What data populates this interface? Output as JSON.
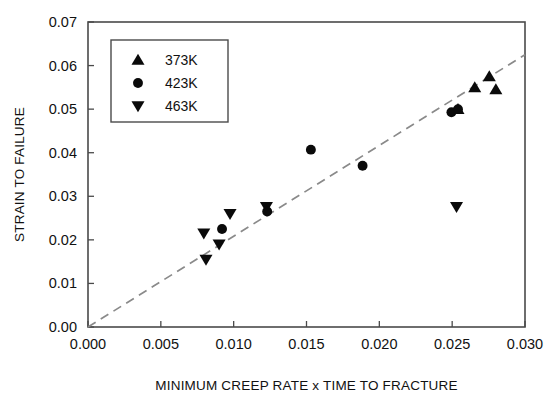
{
  "chart_data": {
    "type": "scatter",
    "title": "",
    "xlabel": "MINIMUM CREEP RATE x TIME TO FRACTURE",
    "ylabel": "STRAIN TO FAILURE",
    "xlim": [
      0.0,
      0.03
    ],
    "ylim": [
      0.0,
      0.07
    ],
    "xticks": [
      0.0,
      0.005,
      0.01,
      0.015,
      0.02,
      0.025,
      0.03
    ],
    "xticklabels": [
      "0.000",
      "0.005",
      "0.010",
      "0.015",
      "0.020",
      "0.025",
      "0.030"
    ],
    "yticks": [
      0.0,
      0.01,
      0.02,
      0.03,
      0.04,
      0.05,
      0.06,
      0.07
    ],
    "yticklabels": [
      "0.00",
      "0.01",
      "0.02",
      "0.03",
      "0.04",
      "0.05",
      "0.06",
      "0.07"
    ],
    "grid": false,
    "legend_position": "upper left",
    "series": [
      {
        "name": "373K",
        "marker": "triangle-up",
        "color": "#0a0a0a",
        "points": [
          {
            "x": 0.0254,
            "y": 0.05
          },
          {
            "x": 0.02655,
            "y": 0.055
          },
          {
            "x": 0.02755,
            "y": 0.0575
          },
          {
            "x": 0.028,
            "y": 0.0545
          }
        ]
      },
      {
        "name": "423K",
        "marker": "circle",
        "color": "#0a0a0a",
        "points": [
          {
            "x": 0.0092,
            "y": 0.0225
          },
          {
            "x": 0.0123,
            "y": 0.0265
          },
          {
            "x": 0.0153,
            "y": 0.0407
          },
          {
            "x": 0.01885,
            "y": 0.037
          },
          {
            "x": 0.02495,
            "y": 0.0493
          },
          {
            "x": 0.0254,
            "y": 0.05
          }
        ]
      },
      {
        "name": "463K",
        "marker": "triangle-down",
        "color": "#0a0a0a",
        "points": [
          {
            "x": 0.00795,
            "y": 0.0215
          },
          {
            "x": 0.0081,
            "y": 0.0155
          },
          {
            "x": 0.009,
            "y": 0.019
          },
          {
            "x": 0.00975,
            "y": 0.026
          },
          {
            "x": 0.01225,
            "y": 0.0276
          },
          {
            "x": 0.0253,
            "y": 0.0276
          }
        ]
      }
    ],
    "fit_line": {
      "name": "linear-fit",
      "style": "dashed",
      "color": "#8a8a8a",
      "x_start": 0.0,
      "y_start": 0.0,
      "x_end": 0.03,
      "y_end": 0.0625
    }
  },
  "legend": {
    "entries": [
      {
        "label": "373K",
        "marker": "triangle-up"
      },
      {
        "label": "423K",
        "marker": "circle"
      },
      {
        "label": "463K",
        "marker": "triangle-down"
      }
    ]
  }
}
